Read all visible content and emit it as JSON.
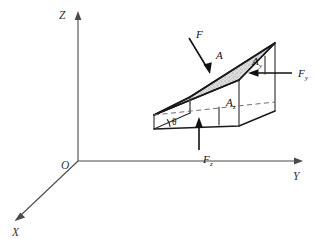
{
  "figure": {
    "background_color": "#ffffff",
    "line_color": "#1a1a1a",
    "axis_color": "#4a4a4a",
    "dashed_color": "#6d6d6d",
    "shaded_face_color": "#d8d8d8"
  },
  "axes": {
    "origin_label": "O",
    "x_label": "X",
    "y_label": "Y",
    "z_label": "Z"
  },
  "labels": {
    "force_resultant": "F",
    "force_y_base": "F",
    "force_y_sub": "y",
    "force_z_base": "F",
    "force_z_sub": "z",
    "area_inclined": "A",
    "area_y_base": "A",
    "area_y_sub": "y",
    "area_z_base": "A",
    "area_z_sub": "z",
    "angle": "θ"
  }
}
